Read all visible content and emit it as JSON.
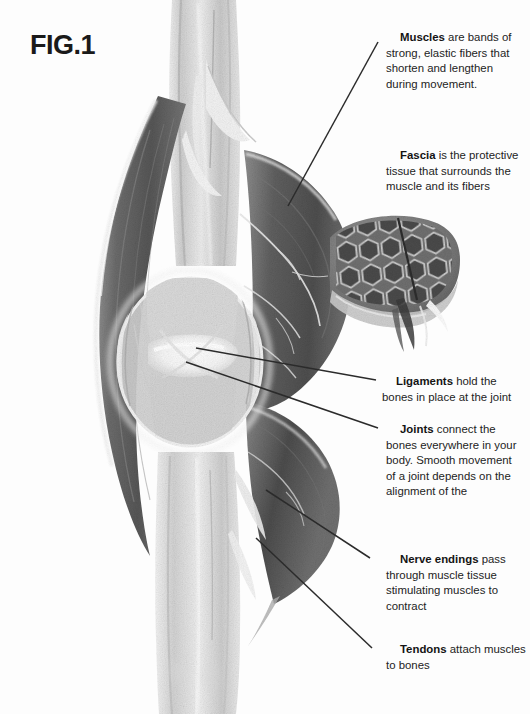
{
  "figure": {
    "label": "FIG.1",
    "style": "grayscale-halftone-scan"
  },
  "callouts": [
    {
      "id": "muscles",
      "term": "Muscles",
      "text": " are bands of strong, elastic fibers that shorten and lengthen during movement.",
      "full": "Muscles are bands of strong, elastic fibers that shorten and lengthen during movement.",
      "leader": {
        "from": [
          378,
          42
        ],
        "to": [
          288,
          206
        ]
      }
    },
    {
      "id": "fascia",
      "term": "Fascia",
      "text": " is the protective tissue that surrounds the muscle and its fibers",
      "full": "Fascia is the protective tissue that surrounds the muscle and its fibers",
      "leader": {
        "from": [
          398,
          218
        ],
        "to": [
          418,
          292
        ]
      }
    },
    {
      "id": "ligaments",
      "term": "Ligaments",
      "text": " hold the bones in place at the joint",
      "full": "Ligaments hold the bones in place at the joint",
      "leader": {
        "from": [
          376,
          380
        ],
        "to": [
          196,
          348
        ]
      }
    },
    {
      "id": "joints",
      "term": "Joints",
      "text": " connect the bones everywhere in your body. Smooth movement of a joint depends on the alignment of the",
      "full": "Joints connect the bones everywhere in your body. Smooth movement of a joint depends on the alignment of the",
      "leader": {
        "from": [
          378,
          428
        ],
        "to": [
          186,
          362
        ]
      }
    },
    {
      "id": "nerve-endings",
      "term": "Nerve endings",
      "text": " pass through muscle tissue stimulating muscles to contract",
      "full": "Nerve endings pass through muscle tissue stimulating muscles to contract",
      "leader": {
        "from": [
          370,
          558
        ],
        "to": [
          266,
          490
        ]
      }
    },
    {
      "id": "tendons",
      "term": "Tendons",
      "text": " attach muscles to bones",
      "full": "Tendons attach muscles to bones",
      "leader": {
        "from": [
          372,
          648
        ],
        "to": [
          256,
          538
        ]
      }
    }
  ],
  "illustration_parts": [
    {
      "name": "bone-shaft-upper",
      "description": "light gray long bone shaft running down the center from the top"
    },
    {
      "name": "bone-shaft-lower",
      "description": "light gray long bone shaft continuing below the joint to the bottom"
    },
    {
      "name": "muscle-belly-left",
      "description": "dark spindle-shaped muscle belly on the left side"
    },
    {
      "name": "muscle-mass-right",
      "description": "large dark muscle mass on the right with branching white nerve threads"
    },
    {
      "name": "joint-capsule",
      "description": "central joint with bright cartilage, ligaments and capsule"
    },
    {
      "name": "fascia-inset",
      "description": "honeycomb cross-section inset showing hexagonal muscle fiber bundles wrapped in fascia"
    },
    {
      "name": "tendon-band",
      "description": "pale tendon bands attaching muscle to bone near the joint"
    }
  ],
  "colors": {
    "page_background": "#fdfdfd",
    "text": "#232323",
    "term": "#141414",
    "leader_line": "#2b2b2b",
    "muscle_dark": "#585858",
    "muscle_mid": "#7c7c7c",
    "bone_light": "#d8d8d8",
    "highlight": "#ffffff"
  }
}
